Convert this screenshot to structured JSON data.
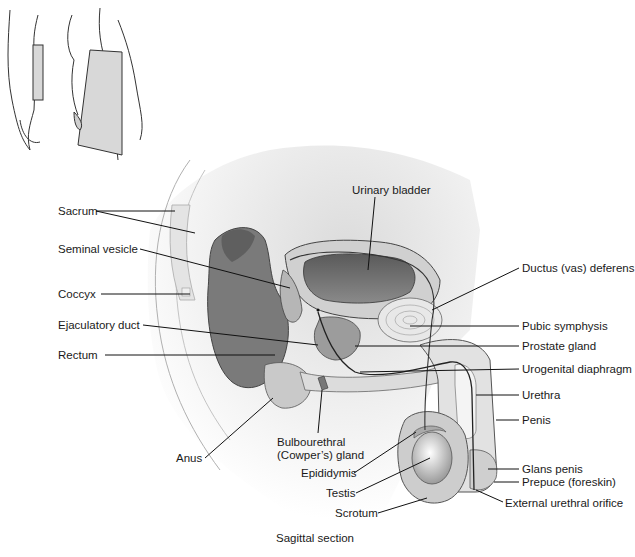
{
  "figure": {
    "caption": "Sagittal section",
    "inset": {
      "description": "Body outline showing sagittal section plane"
    }
  },
  "labels": [
    {
      "id": "sacrum",
      "text": "Sacrum",
      "x": 58,
      "y": 207,
      "side": "left"
    },
    {
      "id": "seminal-vesicle",
      "text": "Seminal vesicle",
      "x": 58,
      "y": 245,
      "side": "left"
    },
    {
      "id": "coccyx",
      "text": "Coccyx",
      "x": 58,
      "y": 288,
      "side": "left"
    },
    {
      "id": "ejaculatory-duct",
      "text": "Ejaculatory duct",
      "x": 58,
      "y": 320,
      "side": "left"
    },
    {
      "id": "rectum",
      "text": "Rectum",
      "x": 58,
      "y": 348,
      "side": "left"
    },
    {
      "id": "anus",
      "text": "Anus",
      "x": 176,
      "y": 452,
      "side": "left"
    },
    {
      "id": "urinary-bladder",
      "text": "Urinary bladder",
      "x": 352,
      "y": 186,
      "side": "top"
    },
    {
      "id": "ductus-deferens",
      "text": "Ductus (vas) deferens",
      "x": 522,
      "y": 263,
      "side": "right"
    },
    {
      "id": "pubic-symphysis",
      "text": "Pubic symphysis",
      "x": 522,
      "y": 320,
      "side": "right"
    },
    {
      "id": "prostate-gland",
      "text": "Prostate gland",
      "x": 522,
      "y": 340,
      "side": "right"
    },
    {
      "id": "urogenital-diaphragm",
      "text": "Urogenital diaphragm",
      "x": 522,
      "y": 363,
      "side": "right"
    },
    {
      "id": "urethra",
      "text": "Urethra",
      "x": 522,
      "y": 389,
      "side": "right"
    },
    {
      "id": "penis",
      "text": "Penis",
      "x": 522,
      "y": 413,
      "side": "right"
    },
    {
      "id": "glans-penis",
      "text": "Glans penis",
      "x": 522,
      "y": 463,
      "side": "right"
    },
    {
      "id": "prepuce",
      "text": "Prepuce (foreskin)",
      "x": 522,
      "y": 476,
      "side": "right"
    },
    {
      "id": "external-urethral-orifice",
      "text": "External urethral orifice",
      "x": 505,
      "y": 497,
      "side": "right"
    },
    {
      "id": "bulbourethral-1",
      "text": "Bulbourethral",
      "x": 277,
      "y": 437,
      "side": "bottom"
    },
    {
      "id": "bulbourethral-2",
      "text": "(Cowper’s) gland",
      "x": 277,
      "y": 451,
      "side": "bottom"
    },
    {
      "id": "epididymis",
      "text": "Epididymis",
      "x": 301,
      "y": 467,
      "side": "bottom"
    },
    {
      "id": "testis",
      "text": "Testis",
      "x": 326,
      "y": 488,
      "side": "bottom"
    },
    {
      "id": "scrotum",
      "text": "Scrotum",
      "x": 335,
      "y": 508,
      "side": "bottom"
    }
  ],
  "colors": {
    "ink": "#1a1a1a",
    "tissue_dark": "#6e6e6e",
    "tissue_mid": "#a8a8a8",
    "tissue_light": "#d6d6d6",
    "bone": "#e8e8e8",
    "background": "#ffffff"
  }
}
